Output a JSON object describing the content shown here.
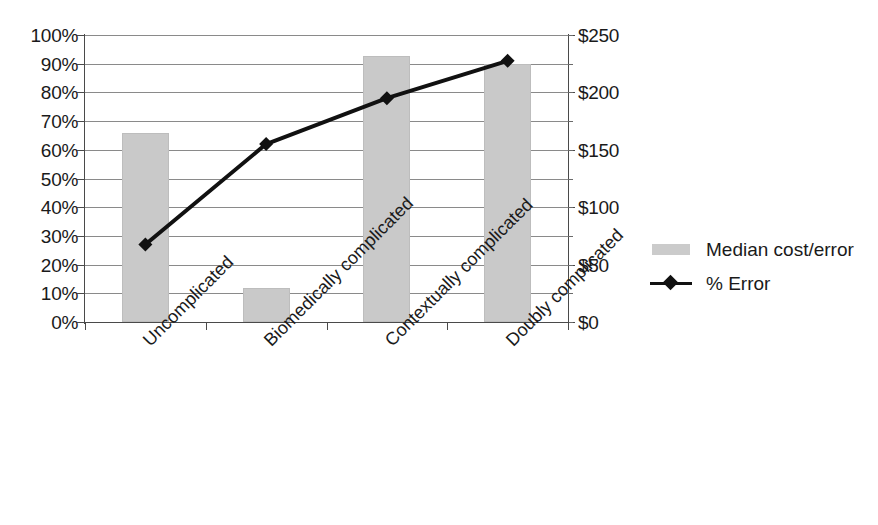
{
  "chart_data": {
    "type": "bar",
    "title": "",
    "subtitle": "",
    "xlabel": "",
    "ylabel": "",
    "categories": [
      "Uncomplicated",
      "Biomedically complicated",
      "Contextually complicated",
      "Doubly complicated"
    ],
    "series": [
      {
        "name": "Median cost/error",
        "type": "bar",
        "axis": "right",
        "unit": "$",
        "values": [
          165,
          30,
          232,
          225
        ],
        "values_percent_of_left_axis": [
          66,
          12,
          93,
          90
        ],
        "color": "#c9c9c9"
      },
      {
        "name": "% Error",
        "type": "line",
        "axis": "left",
        "unit": "%",
        "values": [
          27,
          62,
          78,
          91
        ],
        "color": "#111111",
        "marker": "diamond"
      }
    ],
    "left_axis": {
      "label": "",
      "min": 0,
      "max": 100,
      "step": 10,
      "tick_labels": [
        "0%",
        "10%",
        "20%",
        "30%",
        "40%",
        "50%",
        "60%",
        "70%",
        "80%",
        "90%",
        "100%"
      ]
    },
    "right_axis": {
      "label": "",
      "min": 0,
      "max": 250,
      "step": 50,
      "tick_labels": [
        "$0",
        "$50",
        "$100",
        "$150",
        "$200",
        "$250"
      ]
    },
    "grid": true,
    "legend_position": "right"
  },
  "legend": {
    "entries": [
      {
        "label": "Median cost/error",
        "key": "bar-swatch"
      },
      {
        "label": "% Error",
        "key": "line-marker-swatch"
      }
    ]
  }
}
